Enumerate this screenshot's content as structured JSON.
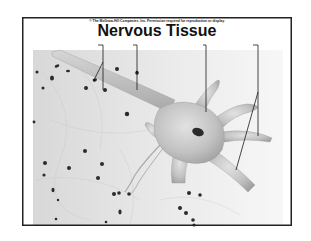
{
  "slide": {
    "copyright": "© The McGraw-Hill Companies, Inc. Permission required for reproduction or display.",
    "title": "Nervous Tissue"
  },
  "illustration": {
    "subject": "neuron",
    "labels": [
      {
        "id": "neuroglia",
        "text": ""
      },
      {
        "id": "axon",
        "text": ""
      },
      {
        "id": "cell-body",
        "text": ""
      },
      {
        "id": "dendrites",
        "text": ""
      }
    ]
  },
  "colors": {
    "border": "#222222",
    "tissue_bg": "#e6e6e6",
    "neuron": "#bdbdbd",
    "nucleus": "#2a2a2a"
  }
}
